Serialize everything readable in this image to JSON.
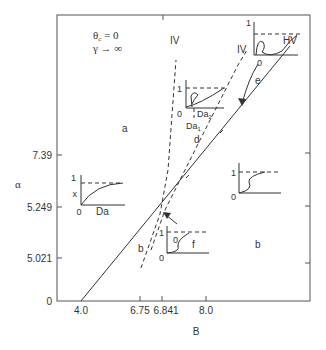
{
  "diagram": {
    "conditions": {
      "line1": "θ",
      "line1_sub": "c",
      "line1_rest": " = 0",
      "line2": "γ → ∞"
    },
    "x_axis": {
      "label": "B",
      "ticks": [
        "4.0",
        "6.75",
        "6.841",
        "8.0"
      ]
    },
    "y_axis": {
      "label": "α",
      "ticks": [
        "0",
        "5.021",
        "5.249",
        "7.39"
      ]
    },
    "regions": {
      "a": "a",
      "b": "b",
      "b_small": "b",
      "d": "d",
      "e": "e",
      "f": "f"
    },
    "curves": {
      "hv": "HV",
      "iv_left": "IV",
      "iv_right": "IV"
    },
    "insets": {
      "left": {
        "one": "1",
        "zero": "0",
        "ylabel": "x",
        "xlabel": "Da"
      },
      "middle": {
        "one": "1",
        "zero": "0",
        "da2": "Da",
        "da2_sub": "2",
        "da1": "Da",
        "da1_sub": "1"
      },
      "top_right": {
        "one": "1",
        "zero": "0"
      },
      "right": {
        "one": "1",
        "zero": "0"
      },
      "bottom": {
        "one": "1",
        "zero": "0",
        "zero_inner": "0"
      }
    }
  }
}
